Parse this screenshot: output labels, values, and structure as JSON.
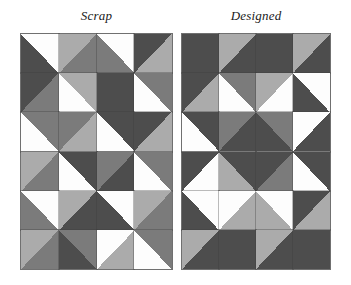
{
  "figure": {
    "name": "quilt-comparison-figure",
    "background": "#ffffff"
  },
  "palette": {
    "white": "#fdfdfd",
    "light": "#ababab",
    "medium": "#7b7b7b",
    "dark": "#4d4d4d",
    "gridline": "#8d8d8d"
  },
  "panels": [
    {
      "id": "scrap",
      "title": "Scrap",
      "x": 20,
      "y": 33,
      "width": 153,
      "height": 237,
      "cols": 4,
      "rows": 6,
      "cells": [
        {
          "dir": "nwse",
          "a": "dark",
          "b": "white"
        },
        {
          "dir": "nesw",
          "a": "light",
          "b": "medium"
        },
        {
          "dir": "nwse",
          "a": "medium",
          "b": "white"
        },
        {
          "dir": "nesw",
          "a": "dark",
          "b": "light"
        },
        {
          "dir": "nesw",
          "a": "dark",
          "b": "medium"
        },
        {
          "dir": "nwse",
          "a": "white",
          "b": "light"
        },
        {
          "dir": "nesw",
          "a": "dark",
          "b": "dark"
        },
        {
          "dir": "nwse",
          "a": "white",
          "b": "medium"
        },
        {
          "dir": "nwse",
          "a": "white",
          "b": "medium"
        },
        {
          "dir": "nesw",
          "a": "medium",
          "b": "light"
        },
        {
          "dir": "nwse",
          "a": "white",
          "b": "dark"
        },
        {
          "dir": "nesw",
          "a": "dark",
          "b": "light"
        },
        {
          "dir": "nesw",
          "a": "light",
          "b": "medium"
        },
        {
          "dir": "nwse",
          "a": "white",
          "b": "dark"
        },
        {
          "dir": "nesw",
          "a": "medium",
          "b": "dark"
        },
        {
          "dir": "nwse",
          "a": "white",
          "b": "medium"
        },
        {
          "dir": "nwse",
          "a": "medium",
          "b": "white"
        },
        {
          "dir": "nesw",
          "a": "light",
          "b": "dark"
        },
        {
          "dir": "nwse",
          "a": "dark",
          "b": "white"
        },
        {
          "dir": "nesw",
          "a": "light",
          "b": "medium"
        },
        {
          "dir": "nesw",
          "a": "light",
          "b": "medium"
        },
        {
          "dir": "nwse",
          "a": "dark",
          "b": "medium"
        },
        {
          "dir": "nesw",
          "a": "white",
          "b": "light"
        },
        {
          "dir": "nwse",
          "a": "white",
          "b": "medium"
        }
      ]
    },
    {
      "id": "designed",
      "title": "Designed",
      "x": 181,
      "y": 33,
      "width": 150,
      "height": 237,
      "cols": 4,
      "rows": 6,
      "cells": [
        {
          "dir": "nwse",
          "a": "dark",
          "b": "dark"
        },
        {
          "dir": "nesw",
          "a": "light",
          "b": "dark"
        },
        {
          "dir": "nwse",
          "a": "dark",
          "b": "dark"
        },
        {
          "dir": "nesw",
          "a": "light",
          "b": "dark"
        },
        {
          "dir": "nesw",
          "a": "dark",
          "b": "light"
        },
        {
          "dir": "nwse",
          "a": "white",
          "b": "medium"
        },
        {
          "dir": "nesw",
          "a": "light",
          "b": "white"
        },
        {
          "dir": "nwse",
          "a": "dark",
          "b": "white"
        },
        {
          "dir": "nwse",
          "a": "white",
          "b": "dark"
        },
        {
          "dir": "nesw",
          "a": "medium",
          "b": "dark"
        },
        {
          "dir": "nwse",
          "a": "dark",
          "b": "medium"
        },
        {
          "dir": "nesw",
          "a": "white",
          "b": "dark"
        },
        {
          "dir": "nesw",
          "a": "dark",
          "b": "white"
        },
        {
          "dir": "nwse",
          "a": "light",
          "b": "dark"
        },
        {
          "dir": "nesw",
          "a": "dark",
          "b": "medium"
        },
        {
          "dir": "nwse",
          "a": "white",
          "b": "dark"
        },
        {
          "dir": "nwse",
          "a": "dark",
          "b": "white"
        },
        {
          "dir": "nesw",
          "a": "white",
          "b": "light"
        },
        {
          "dir": "nwse",
          "a": "light",
          "b": "white"
        },
        {
          "dir": "nesw",
          "a": "dark",
          "b": "light"
        },
        {
          "dir": "nesw",
          "a": "light",
          "b": "dark"
        },
        {
          "dir": "nwse",
          "a": "dark",
          "b": "dark"
        },
        {
          "dir": "nesw",
          "a": "light",
          "b": "dark"
        },
        {
          "dir": "nwse",
          "a": "dark",
          "b": "dark"
        }
      ]
    }
  ]
}
